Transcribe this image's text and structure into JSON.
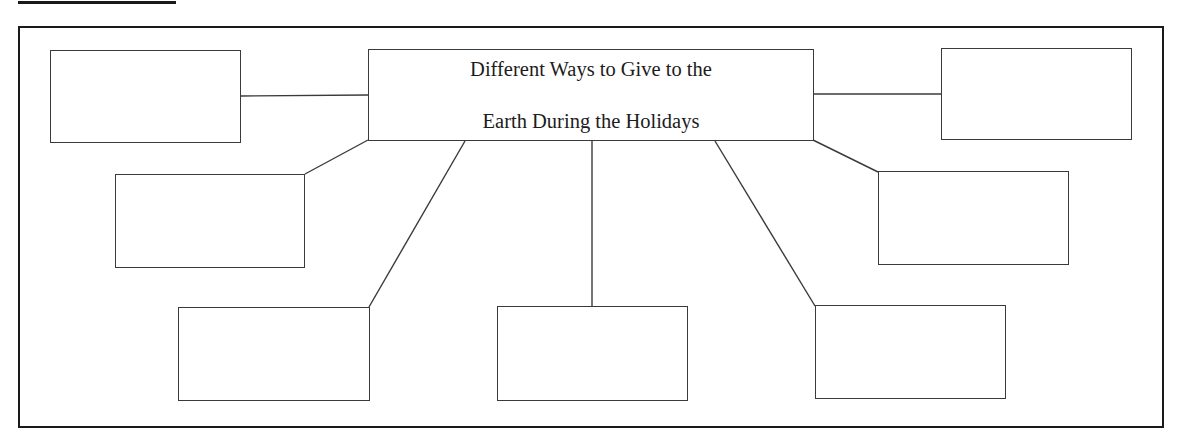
{
  "diagram": {
    "type": "web-organizer",
    "center": {
      "title_line1": "Different Ways to Give to the",
      "title_line2": "Earth During the Holidays",
      "box": {
        "x": 368,
        "y": 49,
        "w": 446,
        "h": 92
      }
    },
    "nodes": [
      {
        "id": "top-left",
        "text": "",
        "box": {
          "x": 50,
          "y": 50,
          "w": 191,
          "h": 93
        }
      },
      {
        "id": "middle-left",
        "text": "",
        "box": {
          "x": 115,
          "y": 174,
          "w": 190,
          "h": 94
        }
      },
      {
        "id": "bottom-left",
        "text": "",
        "box": {
          "x": 178,
          "y": 307,
          "w": 192,
          "h": 94
        }
      },
      {
        "id": "bottom-center",
        "text": "",
        "box": {
          "x": 497,
          "y": 306,
          "w": 191,
          "h": 95
        }
      },
      {
        "id": "bottom-right",
        "text": "",
        "box": {
          "x": 815,
          "y": 305,
          "w": 191,
          "h": 94
        }
      },
      {
        "id": "middle-right",
        "text": "",
        "box": {
          "x": 878,
          "y": 171,
          "w": 191,
          "h": 94
        }
      },
      {
        "id": "top-right",
        "text": "",
        "box": {
          "x": 941,
          "y": 48,
          "w": 191,
          "h": 92
        }
      }
    ],
    "connectors": [
      {
        "to": "top-left",
        "x1": 368,
        "y1": 95,
        "x2": 241,
        "y2": 96
      },
      {
        "to": "middle-left",
        "x1": 368,
        "y1": 140,
        "x2": 305,
        "y2": 174
      },
      {
        "to": "bottom-left",
        "x1": 465,
        "y1": 141,
        "x2": 369,
        "y2": 307
      },
      {
        "to": "bottom-center",
        "x1": 592,
        "y1": 141,
        "x2": 592,
        "y2": 306
      },
      {
        "to": "bottom-right",
        "x1": 715,
        "y1": 141,
        "x2": 815,
        "y2": 306
      },
      {
        "to": "middle-right",
        "x1": 813,
        "y1": 140,
        "x2": 878,
        "y2": 172
      },
      {
        "to": "top-right",
        "x1": 814,
        "y1": 94,
        "x2": 941,
        "y2": 94
      }
    ],
    "colors": {
      "line": "#3a3a3a",
      "frame": "#1a1a1a",
      "background": "#ffffff",
      "text": "#1c1c1c"
    }
  }
}
